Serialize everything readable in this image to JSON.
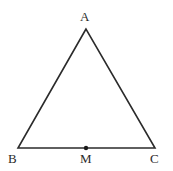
{
  "figure": {
    "kind": "geometry-diagram",
    "background_color": "#ffffff",
    "stroke_color": "#2b2b2b",
    "stroke_width": 1.6,
    "label_color": "#2b2b2b",
    "point_color": "#1a1a1a",
    "point_radius": 2.2,
    "canvas": {
      "width": 173,
      "height": 171
    },
    "vertices": [
      {
        "id": "A",
        "label": "A",
        "x": 86,
        "y": 29,
        "label_x": 80,
        "label_y": 10
      },
      {
        "id": "B",
        "label": "B",
        "x": 18,
        "y": 148,
        "label_x": 8,
        "label_y": 152
      },
      {
        "id": "C",
        "label": "C",
        "x": 155,
        "y": 148,
        "label_x": 150,
        "label_y": 152
      }
    ],
    "points": [
      {
        "id": "M",
        "label": "M",
        "x": 86,
        "y": 148,
        "label_x": 80,
        "label_y": 152,
        "marked": true
      }
    ],
    "edges": [
      {
        "id": "AB",
        "from": "A",
        "to": "B"
      },
      {
        "id": "AC",
        "from": "A",
        "to": "C"
      },
      {
        "id": "BC",
        "from": "B",
        "to": "C"
      }
    ],
    "polygon_points": "86,29 18,148 155,148"
  }
}
